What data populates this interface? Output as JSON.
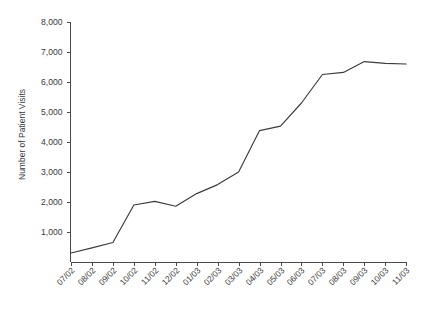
{
  "chart_data": {
    "type": "line",
    "title": "",
    "subtitle": "",
    "xlabel": "",
    "ylabel": "Number of Patient Visits",
    "categories": [
      "07/02",
      "08/02",
      "09/02",
      "10/02",
      "11/02",
      "12/02",
      "01/03",
      "02/03",
      "03/03",
      "04/03",
      "05/03",
      "06/03",
      "07/03",
      "08/03",
      "09/03",
      "10/03",
      "11/03"
    ],
    "values": [
      300,
      470,
      650,
      1900,
      2020,
      1860,
      2280,
      2580,
      3000,
      4380,
      4530,
      5300,
      6250,
      6320,
      6680,
      6620,
      6600
    ],
    "series": [
      {
        "name": "Number of Patient Visits",
        "values": [
          300,
          470,
          650,
          1900,
          2020,
          1860,
          2280,
          2580,
          3000,
          4380,
          4530,
          5300,
          6250,
          6320,
          6680,
          6620,
          6600
        ]
      }
    ],
    "ylim": [
      0,
      8000
    ],
    "ytick_values": [
      1000,
      2000,
      3000,
      4000,
      5000,
      6000,
      7000,
      8000
    ],
    "ytick_labels": [
      "1,000",
      "2,000",
      "3,000",
      "4,000",
      "5,000",
      "6,000",
      "7,000",
      "8,000"
    ],
    "xtick_labels": [
      "07/02",
      "08/02",
      "09/02",
      "10/02",
      "11/02",
      "12/02",
      "01/03",
      "02/03",
      "03/03",
      "04/03",
      "05/03",
      "06/03",
      "07/03",
      "08/03",
      "09/03",
      "10/03",
      "11/03"
    ],
    "grid": false,
    "legend": false,
    "legend_position": "none",
    "line_color": "#3b3b3b",
    "axis_color": "#4a4a4a",
    "text_color": "#3a3a3a",
    "background_color": "#ffffff",
    "xtick_label_rotation": 45
  }
}
